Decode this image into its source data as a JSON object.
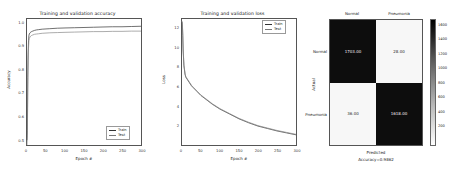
{
  "figure": {
    "panels": [
      "accuracy",
      "loss",
      "confusion-matrix"
    ]
  },
  "chart_data": [
    {
      "type": "line",
      "title": "Training and validation accuracy",
      "xlabel": "Epoch #",
      "ylabel": "Accuracy",
      "xlim": [
        0,
        300
      ],
      "ylim": [
        0.5,
        1.02
      ],
      "xticks": [
        "0",
        "50",
        "100",
        "150",
        "200",
        "250",
        "300"
      ],
      "yticks": [
        "0.5",
        "0.6",
        "0.7",
        "0.8",
        "0.9",
        "1.0"
      ],
      "grid": false,
      "legend_position": "lower right",
      "series": [
        {
          "name": "Train",
          "color": "#333333",
          "x": [
            0,
            1,
            2,
            3,
            4,
            5,
            6,
            8,
            10,
            12,
            15,
            20,
            25,
            30,
            40,
            50,
            60,
            80,
            100,
            125,
            150,
            175,
            200,
            225,
            250,
            275,
            300
          ],
          "values": [
            0.52,
            0.56,
            0.78,
            0.88,
            0.93,
            0.951,
            0.958,
            0.963,
            0.966,
            0.968,
            0.97,
            0.973,
            0.975,
            0.976,
            0.978,
            0.979,
            0.98,
            0.982,
            0.983,
            0.984,
            0.985,
            0.986,
            0.987,
            0.988,
            0.988,
            0.989,
            0.99
          ]
        },
        {
          "name": "Test",
          "color": "#777777",
          "x": [
            0,
            1,
            2,
            3,
            4,
            5,
            6,
            8,
            10,
            12,
            15,
            20,
            25,
            30,
            40,
            50,
            60,
            80,
            100,
            125,
            150,
            175,
            200,
            225,
            250,
            275,
            300
          ],
          "values": [
            0.5,
            0.54,
            0.73,
            0.85,
            0.9,
            0.93,
            0.94,
            0.946,
            0.95,
            0.952,
            0.954,
            0.957,
            0.958,
            0.959,
            0.961,
            0.962,
            0.963,
            0.964,
            0.965,
            0.966,
            0.967,
            0.968,
            0.968,
            0.969,
            0.969,
            0.97,
            0.97
          ]
        }
      ]
    },
    {
      "type": "line",
      "title": "Training and validation loss",
      "xlabel": "Epoch #",
      "ylabel": "Loss",
      "xlim": [
        0,
        300
      ],
      "ylim": [
        0,
        13
      ],
      "xticks": [
        "0",
        "50",
        "100",
        "150",
        "200",
        "250",
        "300"
      ],
      "yticks": [
        "2",
        "4",
        "6",
        "8",
        "10",
        "12"
      ],
      "grid": false,
      "legend_position": "upper right",
      "series": [
        {
          "name": "Train",
          "color": "#333333",
          "x": [
            0,
            1,
            2,
            3,
            5,
            8,
            10,
            15,
            20,
            25,
            30,
            40,
            50,
            60,
            80,
            100,
            125,
            150,
            175,
            200,
            225,
            250,
            275,
            300
          ],
          "values": [
            12.7,
            12.4,
            11.3,
            9.8,
            8.2,
            7.3,
            7.0,
            6.7,
            6.4,
            6.1,
            5.9,
            5.5,
            5.1,
            4.8,
            4.2,
            3.7,
            3.2,
            2.7,
            2.3,
            1.95,
            1.7,
            1.45,
            1.25,
            1.05
          ]
        },
        {
          "name": "Test",
          "color": "#777777",
          "x": [
            0,
            1,
            2,
            3,
            5,
            8,
            10,
            15,
            20,
            25,
            30,
            40,
            50,
            60,
            80,
            100,
            125,
            150,
            175,
            200,
            225,
            250,
            275,
            300
          ],
          "values": [
            12.8,
            12.5,
            11.5,
            10.0,
            8.3,
            7.35,
            7.05,
            6.75,
            6.45,
            6.15,
            5.95,
            5.55,
            5.15,
            4.85,
            4.25,
            3.75,
            3.25,
            2.75,
            2.35,
            2.0,
            1.75,
            1.5,
            1.3,
            1.1
          ]
        }
      ]
    },
    {
      "type": "heatmap",
      "subtype": "confusion-matrix",
      "xlabel": "Predicted",
      "ylabel": "Actual",
      "footnote": "Accuracy=0.9862",
      "col_labels": [
        "Normal",
        "Pneumonia"
      ],
      "row_labels": [
        "Normal",
        "Pneumonia"
      ],
      "cells": [
        [
          "1703.00",
          "28.00"
        ],
        [
          "36.00",
          "1618.00"
        ]
      ],
      "colorbar": {
        "ticks": [
          "1600",
          "1400",
          "1200",
          "1000",
          "800",
          "600",
          "400",
          "200"
        ],
        "vmin": 0,
        "vmax": 1750
      }
    }
  ],
  "legends": {
    "train": "Train",
    "test": "Test"
  }
}
